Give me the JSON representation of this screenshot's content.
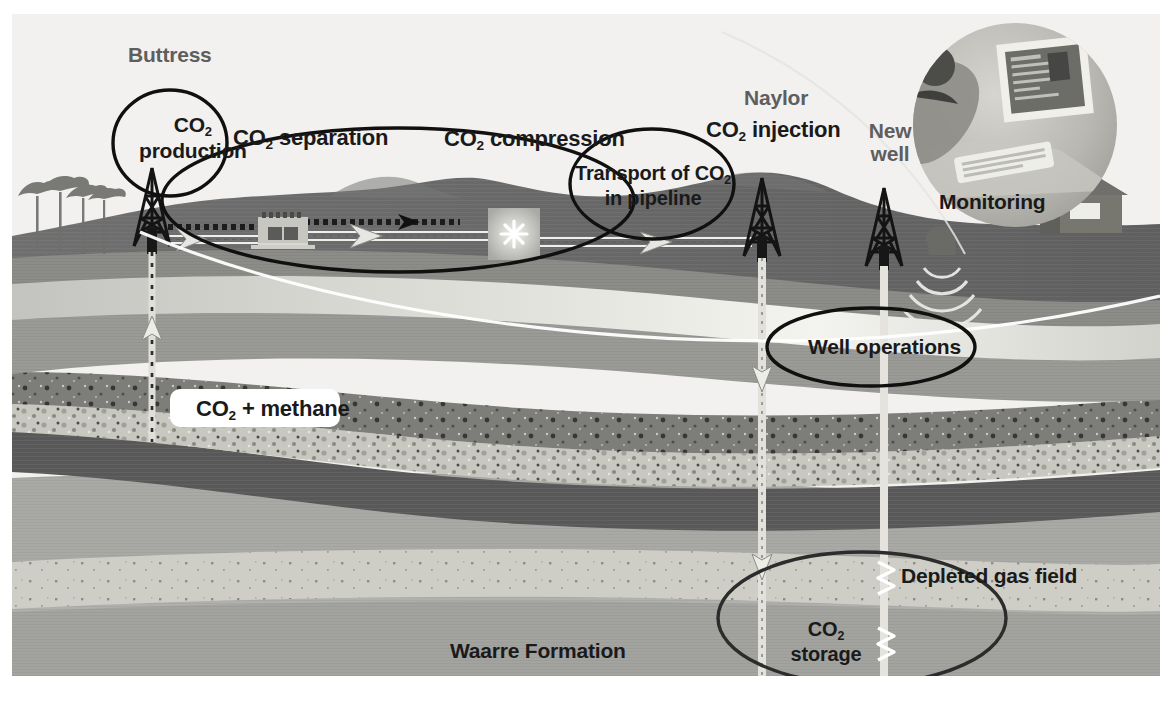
{
  "figure": {
    "background_color": "#ffffff",
    "sky_color": "#f2f1ef"
  },
  "labels": {
    "buttress": "Buttress",
    "co2_production_line1": "CO",
    "co2_production_sub": "2",
    "co2_production_line2": "production",
    "co2_separation": "CO",
    "co2_separation_sub": "2",
    "co2_separation_rest": " separation",
    "co2_compression": "CO",
    "co2_compression_sub": "2",
    "co2_compression_rest": " compression",
    "transport_line1": "Transport of CO",
    "transport_sub": "2",
    "transport_line2": "in pipeline",
    "naylor": "Naylor",
    "co2_injection": "CO",
    "co2_injection_sub": "2",
    "co2_injection_rest": " injection",
    "new_well_line1": "New",
    "new_well_line2": "well",
    "monitoring": "Monitoring",
    "well_operations": "Well operations",
    "co2_methane": "CO",
    "co2_methane_sub": "2",
    "co2_methane_rest": " + methane",
    "depleted_gas_field": "Depleted gas field",
    "co2_storage_line1": "CO",
    "co2_storage_sub": "2",
    "co2_storage_line2": "storage",
    "waarre_formation": "Waarre Formation"
  },
  "colors": {
    "sky": "#f2f1ef",
    "topsoil_dark": "#6b6b6b",
    "subsoil": "#8f8f8f",
    "pale_band": "#cfcfcb",
    "mid_gray": "#a3a3a1",
    "reservoir_speckle_dark": "#7e7e7c",
    "reservoir_speckle_light": "#c4c3bd",
    "seal_dark": "#5a5a5a",
    "waarre": "#a0a09d",
    "sand_band": "#cdccc4",
    "deep_gray": "#adadaa",
    "annotation_outline": "#111111",
    "white_curve": "#ffffff",
    "well_casing": "#d8d8d4"
  },
  "annotations": [
    {
      "name": "co2-production-ellipse",
      "cx": 170,
      "cy": 143,
      "rx": 57,
      "ry": 53
    },
    {
      "name": "separation-compression-ellipse",
      "cx": 398,
      "cy": 200,
      "rx": 236,
      "ry": 72
    },
    {
      "name": "transport-ellipse",
      "cx": 652,
      "cy": 184,
      "rx": 82,
      "ry": 55
    },
    {
      "name": "well-operations-ellipse",
      "cx": 871,
      "cy": 347,
      "rx": 104,
      "ry": 39
    },
    {
      "name": "co2-storage-ellipse",
      "cx": 862,
      "cy": 618,
      "rx": 144,
      "ry": 66
    },
    {
      "name": "monitoring-circle",
      "cx": 1015,
      "cy": 125,
      "r": 102
    }
  ],
  "wells": [
    {
      "name": "buttress-production-well",
      "label": "Buttress",
      "x": 152,
      "flow": "up",
      "top": 228,
      "bottom": 440
    },
    {
      "name": "naylor-injection-well",
      "label": "Naylor",
      "x": 762,
      "flow": "down",
      "top": 238,
      "bottom": 690
    },
    {
      "name": "new-monitoring-well",
      "label": "New well",
      "x": 884,
      "flow": "none",
      "top": 248,
      "bottom": 690
    }
  ],
  "surface_items": [
    {
      "name": "tree-cluster",
      "x": 10,
      "y": 170
    },
    {
      "name": "buttress-derrick",
      "x": 152,
      "y": 165
    },
    {
      "name": "separation-plant",
      "x": 255,
      "y": 210
    },
    {
      "name": "compression-station",
      "x": 490,
      "y": 205
    },
    {
      "name": "naylor-derrick",
      "x": 762,
      "y": 175
    },
    {
      "name": "new-well-derrick",
      "x": 884,
      "y": 180
    },
    {
      "name": "farm-house",
      "x": 1055,
      "y": 195
    },
    {
      "name": "seismic-source-truck",
      "x": 935,
      "y": 240
    }
  ]
}
